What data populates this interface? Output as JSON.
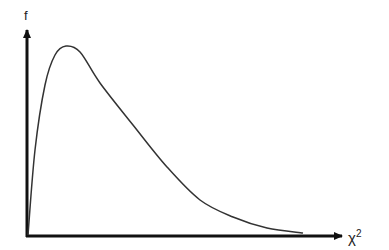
{
  "chart_data": {
    "type": "line",
    "title": "",
    "xlabel": "χ",
    "xlabel_superscript": "2",
    "ylabel": "f",
    "grid": false,
    "legend": null,
    "series": [
      {
        "name": "chi-square density",
        "points_px": [
          [
            28,
            235
          ],
          [
            35,
            150
          ],
          [
            45,
            85
          ],
          [
            55,
            55
          ],
          [
            66,
            46
          ],
          [
            80,
            52
          ],
          [
            100,
            83
          ],
          [
            133,
            125
          ],
          [
            167,
            167
          ],
          [
            200,
            200
          ],
          [
            233,
            217
          ],
          [
            267,
            228
          ],
          [
            303,
            233
          ]
        ]
      }
    ],
    "colors": {
      "curve": "#333333",
      "axes": "#111111"
    }
  }
}
